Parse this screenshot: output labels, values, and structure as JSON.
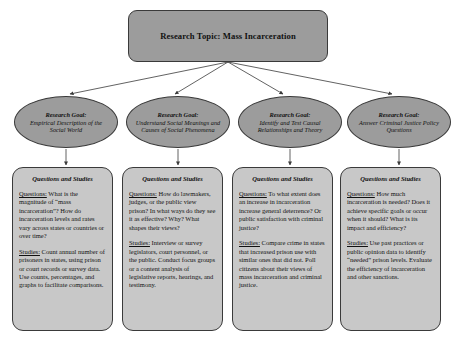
{
  "topic": {
    "label": "Research Topic:  Mass Incarceration"
  },
  "goals": [
    {
      "head": "Research Goal:",
      "body": "Empirical Description of the Social World"
    },
    {
      "head": "Research Goal:",
      "body": "Understand Social Meanings and Causes of Social Phenomena"
    },
    {
      "head": "Research Goal:",
      "body": "Identify and Test Causal Relationships and Theory"
    },
    {
      "head": "Research Goal:",
      "body": "Answer Criminal Justice Policy Questions"
    }
  ],
  "columns": [
    {
      "title": "Questions and Studies",
      "questions_lead": "Questions:",
      "questions_text": "  What is the magnitude of “mass incarceration”? How do incarceration levels and rates vary across states or countries or over time?",
      "studies_lead": "Studies:",
      "studies_text": "  Count annual number of prisoners in states, using prison or court records or survey data.  Use counts, percentages, and graphs to facilitate comparisons."
    },
    {
      "title": "Questions and Studies",
      "questions_lead": "Questions:",
      "questions_text": "  How do lawmakers, judges, or the public view prison?  In what ways do they see it as effective?  Why?  What shapes their views?",
      "studies_lead": "Studies:",
      "studies_text": "  Interview or survey legislators, court personnel, or the public. Conduct focus groups or a content analysis of legislative reports, hearings, and testimony."
    },
    {
      "title": "Questions and Studies",
      "questions_lead": "Questions:",
      "questions_text": "  To what extent does an increase in incarceration increase general deterrence?  Or public satisfaction with criminal justice?",
      "studies_lead": "Studies:",
      "studies_text": "  Compare crime in states that increased prison use with similar ones that did not.  Poll citizens about their views of mass incarceration and criminal justice."
    },
    {
      "title": "Questions and Studies",
      "questions_lead": "Questions:",
      "questions_text": "  How much incarceration is needed?  Does it achieve specific goals or occur when it should?  What is its impact and efficiency?",
      "studies_lead": "Studies:",
      "studies_text": "  Use past practices or public opinion data to identify “needed” prison levels. Evaluate the efficiency of incarceration and other sanctions."
    }
  ],
  "colors": {
    "topic_fill": "#9c9c9c",
    "ellipse_fill": "#9c9c9c",
    "box_fill": "#c8c8c8",
    "stroke": "#3a3a3a"
  }
}
